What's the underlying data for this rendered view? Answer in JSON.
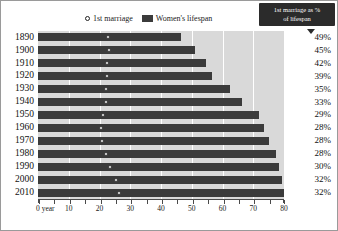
{
  "legend": {
    "marriage_label": "1st marriage",
    "lifespan_label": "Women's lifespan"
  },
  "callout": {
    "line1": "1st marriage as %",
    "line2": "of lifespan"
  },
  "axis": {
    "x_first_label": "0 year",
    "x_labels": [
      "10",
      "20",
      "30",
      "40",
      "50",
      "60",
      "70",
      "80"
    ]
  },
  "colors": {
    "bar": "#3b3b3b",
    "plot_background": "#d9d9d9",
    "gridline": "#ffffff",
    "callout_background": "#2b2b2b",
    "marker_fill": "#ffffff"
  },
  "chart_data": {
    "type": "bar",
    "title": "",
    "subtitle": "",
    "xlabel": "0 year",
    "ylabel": "",
    "xlim": [
      0,
      80
    ],
    "grid": true,
    "legend_position": "top-center",
    "categories": [
      "1890",
      "1900",
      "1910",
      "1920",
      "1930",
      "1940",
      "1950",
      "1960",
      "1970",
      "1980",
      "1990",
      "2000",
      "2010"
    ],
    "series": [
      {
        "name": "Women's lifespan",
        "values": [
          46.5,
          51.0,
          54.5,
          56.5,
          62.5,
          66.5,
          72.0,
          73.5,
          75.0,
          77.5,
          78.5,
          79.5,
          81.0
        ]
      },
      {
        "name": "1st marriage",
        "values": [
          22.8,
          23.0,
          22.5,
          22.3,
          22.0,
          22.0,
          21.0,
          20.5,
          20.8,
          22.0,
          23.5,
          25.5,
          26.5
        ]
      }
    ],
    "annotations": {
      "label": "1st marriage as % of lifespan",
      "values": [
        "49%",
        "45%",
        "42%",
        "39%",
        "35%",
        "33%",
        "29%",
        "28%",
        "28%",
        "28%",
        "30%",
        "32%",
        "32%"
      ]
    }
  }
}
